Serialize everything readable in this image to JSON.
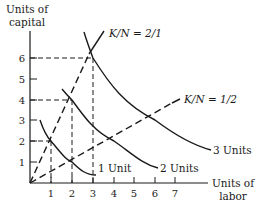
{
  "figure": {
    "type": "isoquant-diagram",
    "y_axis_title": [
      "Units of",
      "capital"
    ],
    "x_axis_title": [
      "Units of",
      "labor"
    ],
    "x_ticks": [
      "1",
      "2",
      "3",
      "4",
      "5",
      "6",
      "7"
    ],
    "y_ticks": [
      "1",
      "2",
      "3",
      "4",
      "5",
      "6"
    ],
    "rays": [
      {
        "label": "K/N = 2/1",
        "slope": 2,
        "style": "dashed-then-solid"
      },
      {
        "label": "K/N = 1/2",
        "slope": 0.5,
        "style": "dashed"
      }
    ],
    "isoquants": [
      {
        "label": "1 Unit",
        "points_on_rays": [
          [
            1,
            2
          ],
          [
            2,
            1
          ]
        ]
      },
      {
        "label": "2 Units",
        "points_on_rays": [
          [
            2,
            4
          ],
          [
            4,
            2
          ]
        ]
      },
      {
        "label": "3 Units",
        "points_on_rays": [
          [
            3,
            6
          ],
          [
            6,
            3
          ]
        ]
      }
    ],
    "guide_lines": [
      {
        "from": [
          0,
          2
        ],
        "to": [
          1,
          2
        ],
        "down_to_x": 1
      },
      {
        "from": [
          0,
          4
        ],
        "to": [
          2,
          4
        ],
        "down_to_x": 2
      },
      {
        "from": [
          0,
          6
        ],
        "to": [
          3,
          6
        ],
        "down_to_x": 3
      }
    ],
    "colors": {
      "ink": "#1a1a1a",
      "background": "#ffffff"
    }
  }
}
